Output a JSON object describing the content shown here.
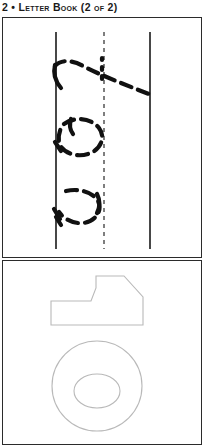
{
  "page": {
    "running_head": "2 • Letter Book (2 of 2)",
    "background_color": "#ffffff",
    "width": 204,
    "height": 447
  },
  "practice_panel": {
    "name": "handwriting-practice-panel",
    "border_color": "#2b2b2b",
    "guides": {
      "solid_line_color": "#1a1a1a",
      "dashed_line_color": "#3a3a3a",
      "left_margin_x": 53,
      "midline_x": 101,
      "right_margin_x": 147,
      "line_top_y": 14,
      "line_bottom_y": 231
    },
    "trace_strokes": [
      {
        "label": "stroke-1-crossed-t",
        "stroke_color": "#111111"
      },
      {
        "label": "stroke-2-oval-loop",
        "stroke_color": "#111111"
      },
      {
        "label": "stroke-3-curved-s",
        "stroke_color": "#111111"
      }
    ]
  },
  "shapes_panel": {
    "name": "shapes-panel",
    "border_color": "#2b2b2b",
    "outline_color": "#b9b9b9",
    "shapes": [
      {
        "label": "arrow-polygon"
      },
      {
        "label": "ring-annulus"
      }
    ]
  }
}
